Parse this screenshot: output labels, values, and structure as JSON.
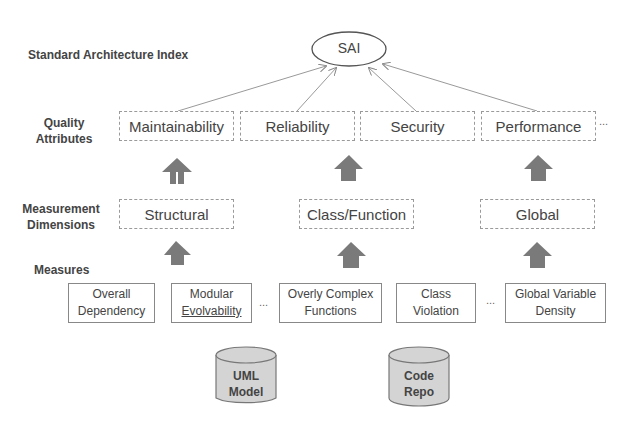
{
  "title": "Standard Architecture Index",
  "root_node": "SAI",
  "levels": {
    "quality_attributes": "Quality Attributes",
    "measurement_dimensions": "Measurement Dimensions",
    "measures": "Measures"
  },
  "quality_attributes": [
    "Maintainability",
    "Reliability",
    "Security",
    "Performance"
  ],
  "quality_attributes_more": "...",
  "measurement_dimensions": [
    "Structural",
    "Class/Function",
    "Global"
  ],
  "measures": [
    {
      "line1": "Overall",
      "line2": "Dependency"
    },
    {
      "line1": "Modular",
      "line2": "Evolvability"
    },
    {
      "line1": "Overly Complex",
      "line2": "Functions"
    },
    {
      "line1": "Class",
      "line2": "Violation"
    },
    {
      "line1": "Global Variable",
      "line2": "Density"
    }
  ],
  "measures_gap_1": "...",
  "measures_gap_2": "...",
  "data_sources": [
    {
      "line1": "UML",
      "line2": "Model"
    },
    {
      "line1": "Code",
      "line2": "Repo"
    }
  ]
}
